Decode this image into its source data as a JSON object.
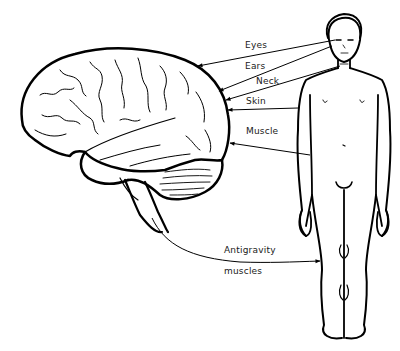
{
  "diagram": {
    "type": "sensory-input-to-brain",
    "figures": {
      "brain": "brain-lateral-view",
      "body": "human-body-front-view"
    },
    "labels": {
      "eyes": "Eyes",
      "ears": "Ears",
      "neck": "Neck",
      "skin": "Skin",
      "muscle": "Muscle",
      "antigravity_line1": "Antigravity",
      "antigravity_line2": "muscles"
    },
    "connections": [
      {
        "from": "Eyes",
        "to": "brain"
      },
      {
        "from": "Ears",
        "to": "brain"
      },
      {
        "from": "Neck",
        "to": "brain"
      },
      {
        "from": "Skin",
        "to": "brain"
      },
      {
        "from": "Muscle",
        "to": "brain"
      },
      {
        "from": "brainstem",
        "to": "Antigravity muscles"
      }
    ],
    "colors": {
      "line": "#000000",
      "background": "#ffffff"
    }
  }
}
